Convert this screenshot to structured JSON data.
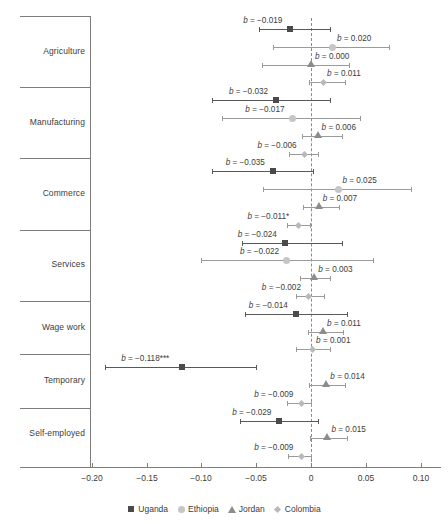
{
  "chart_data": {
    "type": "scatter",
    "title": "",
    "xlabel": "",
    "ylabel": "",
    "xlim": [
      -0.215,
      0.105
    ],
    "xticks": [
      -0.2,
      -0.15,
      -0.1,
      -0.05,
      0,
      0.05,
      0.1
    ],
    "xticklabels": [
      "−0.20",
      "−0.15",
      "−0.10",
      "−0.05",
      "0",
      "0.05",
      "0.10"
    ],
    "grid": false,
    "reference_line": 0,
    "legend_position": "bottom",
    "categories": [
      "Agriculture",
      "Manufacturing",
      "Commerce",
      "Services",
      "Wage work",
      "Temporary",
      "Self-employed"
    ],
    "series": [
      {
        "name": "Uganda",
        "color": "#4a4a4a",
        "marker": "square"
      },
      {
        "name": "Ethiopia",
        "color": "#c6c6c6",
        "marker": "circle"
      },
      {
        "name": "Jordan",
        "color": "#8c8c8c",
        "marker": "triangle"
      },
      {
        "name": "Colombia",
        "color": "#b9b9b9",
        "marker": "diamond"
      }
    ],
    "points": [
      {
        "category": "Agriculture",
        "series": "Uganda",
        "b": -0.019,
        "label": "b = −0.019",
        "ci_low": -0.047,
        "ci_high": 0.017,
        "label_side": "left"
      },
      {
        "category": "Agriculture",
        "series": "Ethiopia",
        "b": 0.02,
        "label": "b = 0.020",
        "ci_low": -0.035,
        "ci_high": 0.071,
        "label_side": "right"
      },
      {
        "category": "Agriculture",
        "series": "Jordan",
        "b": 0.0,
        "label": "b = 0.000",
        "ci_low": -0.045,
        "ci_high": 0.035,
        "label_side": "right"
      },
      {
        "category": "Agriculture",
        "series": "Colombia",
        "b": 0.011,
        "label": "b = 0.011",
        "ci_low": -0.002,
        "ci_high": 0.031,
        "label_side": "right"
      },
      {
        "category": "Manufacturing",
        "series": "Uganda",
        "b": -0.032,
        "label": "b = −0.032",
        "ci_low": -0.09,
        "ci_high": 0.017,
        "label_side": "left"
      },
      {
        "category": "Manufacturing",
        "series": "Ethiopia",
        "b": -0.017,
        "label": "b = −0.017",
        "ci_low": -0.081,
        "ci_high": 0.045,
        "label_side": "left"
      },
      {
        "category": "Manufacturing",
        "series": "Jordan",
        "b": 0.006,
        "label": "b = 0.006",
        "ci_low": -0.008,
        "ci_high": 0.028,
        "label_side": "right"
      },
      {
        "category": "Manufacturing",
        "series": "Colombia",
        "b": -0.006,
        "label": "b = −0.006",
        "ci_low": -0.02,
        "ci_high": 0.006,
        "label_side": "left"
      },
      {
        "category": "Commerce",
        "series": "Uganda",
        "b": -0.035,
        "label": "b = −0.035",
        "ci_low": -0.09,
        "ci_high": 0.002,
        "label_side": "left"
      },
      {
        "category": "Commerce",
        "series": "Ethiopia",
        "b": 0.025,
        "label": "b = 0.025",
        "ci_low": -0.044,
        "ci_high": 0.091,
        "label_side": "right"
      },
      {
        "category": "Commerce",
        "series": "Jordan",
        "b": 0.007,
        "label": "b = 0.007",
        "ci_low": -0.007,
        "ci_high": 0.026,
        "label_side": "right"
      },
      {
        "category": "Commerce",
        "series": "Colombia",
        "b": -0.011,
        "label": "b = −0.011*",
        "ci_low": -0.022,
        "ci_high": -0.001,
        "label_side": "left"
      },
      {
        "category": "Services",
        "series": "Uganda",
        "b": -0.024,
        "label": "b = −0.024",
        "ci_low": -0.063,
        "ci_high": 0.028,
        "label_side": "left"
      },
      {
        "category": "Services",
        "series": "Ethiopia",
        "b": -0.022,
        "label": "b = −0.022",
        "ci_low": -0.1,
        "ci_high": 0.057,
        "label_side": "left"
      },
      {
        "category": "Services",
        "series": "Jordan",
        "b": 0.003,
        "label": "b = 0.003",
        "ci_low": -0.01,
        "ci_high": 0.017,
        "label_side": "right"
      },
      {
        "category": "Services",
        "series": "Colombia",
        "b": -0.002,
        "label": "b = −0.002",
        "ci_low": -0.014,
        "ci_high": 0.012,
        "label_side": "left"
      },
      {
        "category": "Wage work",
        "series": "Uganda",
        "b": -0.014,
        "label": "b = −0.014",
        "ci_low": -0.06,
        "ci_high": 0.033,
        "label_side": "left"
      },
      {
        "category": "Wage work",
        "series": "Jordan",
        "b": 0.011,
        "label": "b = 0.011",
        "ci_low": -0.003,
        "ci_high": 0.029,
        "label_side": "right"
      },
      {
        "category": "Wage work",
        "series": "Colombia",
        "b": 0.001,
        "label": "b = 0.001",
        "ci_low": -0.014,
        "ci_high": 0.017,
        "label_side": "right"
      },
      {
        "category": "Temporary",
        "series": "Uganda",
        "b": -0.118,
        "label": "b = −0.118***",
        "ci_low": -0.188,
        "ci_high": -0.05,
        "label_side": "left"
      },
      {
        "category": "Temporary",
        "series": "Jordan",
        "b": 0.014,
        "label": "b = 0.014",
        "ci_low": -0.002,
        "ci_high": 0.031,
        "label_side": "right"
      },
      {
        "category": "Temporary",
        "series": "Colombia",
        "b": -0.009,
        "label": "b = −0.009",
        "ci_low": -0.022,
        "ci_high": 0.0,
        "label_side": "left"
      },
      {
        "category": "Self-employed",
        "series": "Uganda",
        "b": -0.029,
        "label": "b = −0.029",
        "ci_low": -0.065,
        "ci_high": 0.006,
        "label_side": "left"
      },
      {
        "category": "Self-employed",
        "series": "Jordan",
        "b": 0.015,
        "label": "b = 0.015",
        "ci_low": -0.001,
        "ci_high": 0.033,
        "label_side": "right"
      },
      {
        "category": "Self-employed",
        "series": "Colombia",
        "b": -0.009,
        "label": "b = −0.009",
        "ci_low": -0.021,
        "ci_high": 0.0,
        "label_side": "left"
      }
    ]
  },
  "legend": {
    "items": [
      {
        "label": "Uganda",
        "marker": "square",
        "color": "#4a4a4a"
      },
      {
        "label": "Ethiopia",
        "marker": "circle",
        "color": "#c6c6c6"
      },
      {
        "label": "Jordan",
        "marker": "triangle",
        "color": "#8c8c8c"
      },
      {
        "label": "Colombia",
        "marker": "diamond",
        "color": "#b9b9b9"
      }
    ]
  },
  "axis": {
    "tick_labels": [
      "−0.20",
      "−0.15",
      "−0.10",
      "−0.05",
      "0",
      "0.05",
      "0.10"
    ]
  },
  "category_labels": [
    "Agriculture",
    "Manufacturing",
    "Commerce",
    "Services",
    "Wage work",
    "Temporary",
    "Self-employed"
  ]
}
